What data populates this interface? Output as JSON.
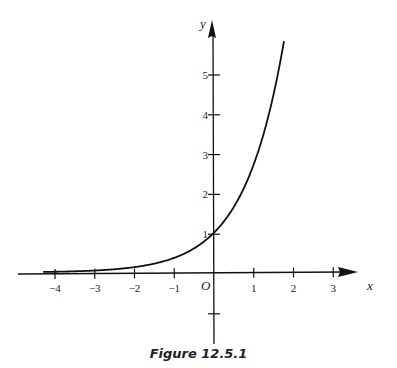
{
  "caption": "Figure 12.5.1",
  "chart_data": {
    "type": "line",
    "title": "",
    "function": "y = e^x",
    "xlabel": "x",
    "ylabel": "y",
    "origin_label": "O",
    "x_ticks": [
      -4,
      -3,
      -2,
      -1,
      1,
      2,
      3
    ],
    "x_tick_labels": [
      "−4",
      "−3",
      "−2",
      "−1",
      "1",
      "2",
      "3"
    ],
    "y_ticks": [
      1,
      2,
      3,
      4,
      5,
      -1
    ],
    "y_tick_labels": [
      "1",
      "2",
      "3",
      "4",
      "5"
    ],
    "xlim": [
      -4.3,
      3.3
    ],
    "ylim": [
      -1.6,
      6
    ],
    "grid": false,
    "series": [
      {
        "name": "e^x",
        "x": [
          -4.3,
          -4,
          -3,
          -2,
          -1,
          0,
          0.5,
          1,
          1.25,
          1.5,
          1.75
        ],
        "y": [
          0.014,
          0.018,
          0.05,
          0.135,
          0.368,
          1,
          1.65,
          2.72,
          3.49,
          4.48,
          5.75
        ]
      }
    ]
  }
}
